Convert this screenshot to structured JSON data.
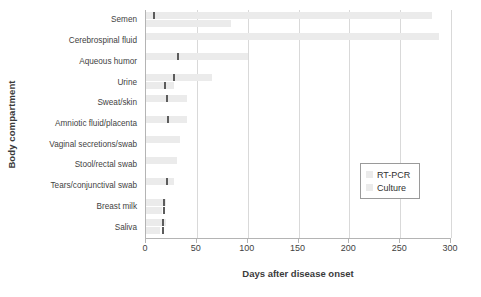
{
  "chart_data": {
    "type": "bar",
    "orientation": "horizontal",
    "title": "",
    "xlabel": "Days after disease onset",
    "ylabel": "Body compartment",
    "xlim": [
      0,
      300
    ],
    "xticks": [
      0,
      50,
      100,
      150,
      200,
      250,
      300
    ],
    "xtick_labels": [
      "0",
      "50",
      "100",
      "150",
      "200",
      "250",
      "300"
    ],
    "grid": "vertical",
    "legend_position": "center-right",
    "categories": [
      "Semen",
      "Cerebrospinal fluid",
      "Aqueous humor",
      "Urine",
      "Sweat/skin",
      "Amniotic fluid/placenta",
      "Vaginal secretions/swab",
      "Stool/rectal swab",
      "Tears/conjunctival swab",
      "Breast milk",
      "Saliva"
    ],
    "series": [
      {
        "name": "RT-PCR",
        "color": "#ebebeb",
        "values": [
          281,
          288,
          100,
          65,
          40,
          40,
          33,
          30,
          28,
          20,
          20
        ],
        "markers": [
          7,
          null,
          30,
          27,
          20,
          21,
          null,
          null,
          20,
          17,
          16
        ]
      },
      {
        "name": "Culture",
        "color": "#ebebeb",
        "values": [
          84,
          0,
          0,
          28,
          0,
          0,
          0,
          0,
          0,
          16,
          14
        ],
        "markers": [
          null,
          null,
          null,
          18,
          null,
          null,
          null,
          null,
          null,
          17,
          16
        ]
      }
    ]
  },
  "legend": {
    "entries": [
      {
        "label": "RT-PCR",
        "color": "#ebebeb"
      },
      {
        "label": "Culture",
        "color": "#ebebeb"
      }
    ]
  },
  "axes": {
    "x_title": "Days after disease onset",
    "y_title": "Body compartment"
  }
}
